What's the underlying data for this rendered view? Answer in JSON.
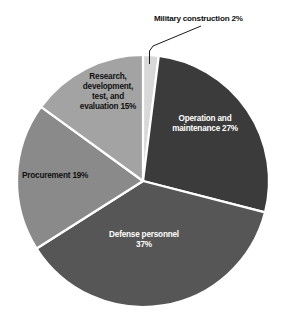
{
  "chart_data": {
    "type": "pie",
    "title": "",
    "subtitle": "",
    "xlabel": "",
    "ylabel": "",
    "legend_position": "none",
    "grid": false,
    "units": "percent",
    "total": 100,
    "start_angle_deg": 0,
    "direction": "clockwise",
    "categories": [
      "Military construction",
      "Operation and maintenance",
      "Defense personnel",
      "Procurement",
      "Research, development, test, and evaluation"
    ],
    "values": [
      2,
      27,
      37,
      19,
      15
    ],
    "slices": [
      {
        "name": "military-construction",
        "label": "Military construction 2%",
        "label_lines": "Military construction 2%",
        "value": 2,
        "color": "#d8d8d8",
        "label_color": "#111111",
        "label_placement": "outside-callout"
      },
      {
        "name": "operation-and-maintenance",
        "label": "Operation and maintenance  27%",
        "label_lines": "Operation and\nmaintenance  27%",
        "value": 27,
        "color": "#3b3b3b",
        "label_color": "#ffffff",
        "label_placement": "inside"
      },
      {
        "name": "defense-personnel",
        "label": "Defense personnel 37%",
        "label_lines": "Defense personnel\n37%",
        "value": 37,
        "color": "#565656",
        "label_color": "#ffffff",
        "label_placement": "inside"
      },
      {
        "name": "procurement",
        "label": "Procurement 19%",
        "label_lines": "Procurement 19%",
        "value": 19,
        "color": "#8a8a8a",
        "label_color": "#111111",
        "label_placement": "inside"
      },
      {
        "name": "research-development-test-evaluation",
        "label": "Research, development, test, and evaluation 15%",
        "label_lines": "Research,\ndevelopment,\ntest, and\nevaluation 15%",
        "value": 15,
        "color": "#a3a3a3",
        "label_color": "#111111",
        "label_placement": "inside"
      }
    ]
  },
  "figure": {
    "background": "#ffffff",
    "separator_color": "#ffffff",
    "leader_line_color": "#1a1a1a"
  }
}
